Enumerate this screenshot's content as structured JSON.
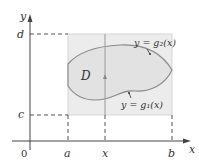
{
  "figure": {
    "axes": {
      "x_label": "x",
      "y_label": "y",
      "origin_label": "0"
    },
    "x_ticks": {
      "a": "a",
      "x": "x",
      "b": "b"
    },
    "y_ticks": {
      "c": "c",
      "d": "d"
    },
    "region_label": "D",
    "upper_curve_label": "y = g₂(x)",
    "lower_curve_label": "y = g₁(x)",
    "colors": {
      "rectangle_fill": "#ececec",
      "rectangle_border": "#d6d6d6",
      "region_fill": "#e2e2e2",
      "curve_stroke": "#8a8a8a",
      "axis_stroke": "#444444",
      "dashed_stroke": "#555555",
      "text": "#333333"
    }
  }
}
